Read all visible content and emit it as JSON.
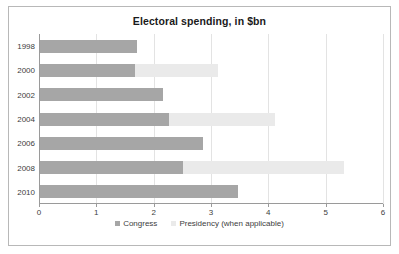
{
  "chart_data": {
    "type": "bar",
    "orientation": "horizontal",
    "stacked": true,
    "title": "Electoral spending, in $bn",
    "xlabel": "",
    "ylabel": "",
    "categories": [
      "1998",
      "2000",
      "2002",
      "2004",
      "2006",
      "2008",
      "2010"
    ],
    "series": [
      {
        "name": "Congress",
        "color": "#a6a6a6",
        "values": [
          1.7,
          1.65,
          2.15,
          2.25,
          2.85,
          2.5,
          3.45
        ]
      },
      {
        "name": "Presidency (when applicable)",
        "color": "#eaeaea",
        "values": [
          0,
          1.45,
          0,
          1.85,
          0,
          2.8,
          0
        ]
      }
    ],
    "totals": [
      1.7,
      3.1,
      2.15,
      4.1,
      2.85,
      5.3,
      3.45
    ],
    "xlim": [
      0,
      6
    ],
    "xticks": [
      "0",
      "1",
      "2",
      "3",
      "4",
      "5",
      "6"
    ],
    "grid": true,
    "grid_axis": "x",
    "legend_position": "bottom"
  },
  "colors": {
    "congress": "#a6a6a6",
    "presidency": "#eaeaea",
    "axis": "#9a9a9a",
    "grid": "#e3e3e3",
    "text": "#404040",
    "title": "#1a1a1a",
    "border": "#b8b8b8"
  }
}
